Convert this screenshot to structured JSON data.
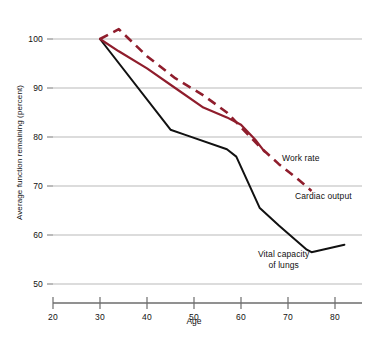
{
  "chart_data": {
    "type": "line",
    "title": "",
    "xlabel": "Age",
    "ylabel": "Average function remaining (percent)",
    "xlim": [
      20,
      86
    ],
    "ylim": [
      48,
      104
    ],
    "xticks": [
      20,
      30,
      40,
      50,
      60,
      70,
      80
    ],
    "yticks": [
      50,
      60,
      70,
      80,
      90,
      100
    ],
    "grid": true,
    "legend_position": "inline-right",
    "series": [
      {
        "name": "Work rate",
        "style": "solid",
        "color": "#8f1d2c",
        "x": [
          30,
          34,
          40,
          46,
          52,
          57,
          60,
          63,
          65
        ],
        "values": [
          100,
          97.5,
          94,
          90,
          86,
          84,
          82.5,
          79.5,
          77
        ]
      },
      {
        "name": "Cardiac output",
        "style": "dashed",
        "color": "#8f1d2c",
        "x": [
          30,
          34,
          40,
          46,
          52,
          57,
          60,
          64,
          68,
          72,
          75
        ],
        "values": [
          100,
          102,
          96.5,
          92,
          88.5,
          85,
          82,
          78,
          74.5,
          71.5,
          69
        ]
      },
      {
        "name": "Vital capacity of lungs",
        "style": "solid",
        "color": "#111111",
        "x": [
          30,
          45,
          48,
          57,
          59,
          64,
          68,
          74,
          75,
          82
        ],
        "values": [
          100,
          81.5,
          80.5,
          77.5,
          76,
          65.5,
          62,
          57,
          56.5,
          58
        ]
      }
    ],
    "labels": {
      "work_rate": "Work rate",
      "cardiac_output": "Cardiac output",
      "vital_capacity_line1": "Vital capacity",
      "vital_capacity_line2": "of lungs"
    },
    "axis_color": "#6d6d6d",
    "grid_color": "#b9b9b9"
  },
  "ticks": {
    "y": {
      "t100": "100",
      "t90": "90",
      "t80": "80",
      "t70": "70",
      "t60": "60",
      "t50": "50"
    },
    "x": {
      "t20": "20",
      "t30": "30",
      "t40": "40",
      "t50": "50",
      "t60": "60",
      "t70": "70",
      "t80": "80"
    }
  }
}
